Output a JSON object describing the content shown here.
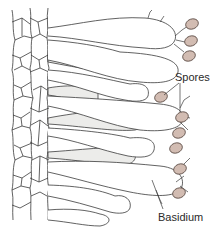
{
  "diagram": {
    "labels": {
      "spores": "Spores",
      "basidium": "Basidium"
    },
    "colors": {
      "stroke": "#3a3a3a",
      "spore_fill": "#d2bcb2",
      "spore_stroke": "#5a4a44",
      "shade_fill": "#ececea",
      "background": "#ffffff"
    },
    "spore_count": 9,
    "basidia_with_spores": 4
  }
}
